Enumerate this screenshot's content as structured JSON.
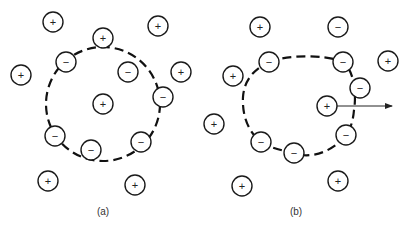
{
  "panels": [
    {
      "label": "(a)",
      "label_pos": [
        103,
        212
      ],
      "boundary": {
        "shape": "circle",
        "cx": 103,
        "cy": 104,
        "r": 57
      },
      "ions": [
        {
          "sign": "+",
          "x": 53,
          "y": 22
        },
        {
          "sign": "+",
          "x": 158,
          "y": 26
        },
        {
          "sign": "+",
          "x": 103,
          "y": 38
        },
        {
          "sign": "−",
          "x": 66,
          "y": 62
        },
        {
          "sign": "−",
          "x": 128,
          "y": 72
        },
        {
          "sign": "+",
          "x": 21,
          "y": 75
        },
        {
          "sign": "+",
          "x": 181,
          "y": 72
        },
        {
          "sign": "−",
          "x": 163,
          "y": 97
        },
        {
          "sign": "+",
          "x": 103,
          "y": 104
        },
        {
          "sign": "−",
          "x": 55,
          "y": 136
        },
        {
          "sign": "−",
          "x": 141,
          "y": 142
        },
        {
          "sign": "−",
          "x": 91,
          "y": 150
        },
        {
          "sign": "+",
          "x": 48,
          "y": 181
        },
        {
          "sign": "+",
          "x": 135,
          "y": 185
        }
      ]
    },
    {
      "label": "(b)",
      "label_pos": [
        296,
        212
      ],
      "boundary": {
        "shape": "path",
        "d": "M 269 62 C 285 55, 325 54, 343 62 C 356 72, 356 100, 354 110 C 353 122, 350 130, 346 135 C 335 150, 312 160, 294 153 C 280 150, 268 147, 261 142 C 248 132, 242 115, 243 97 C 244 82, 252 70, 269 62 Z"
      },
      "arrow": {
        "x1": 337,
        "y1": 106,
        "x2": 392,
        "y2": 106
      },
      "ions": [
        {
          "sign": "+",
          "x": 260,
          "y": 27
        },
        {
          "sign": "−",
          "x": 338,
          "y": 27
        },
        {
          "sign": "−",
          "x": 269,
          "y": 62
        },
        {
          "sign": "−",
          "x": 343,
          "y": 62
        },
        {
          "sign": "+",
          "x": 388,
          "y": 61
        },
        {
          "sign": "+",
          "x": 233,
          "y": 76
        },
        {
          "sign": "−",
          "x": 360,
          "y": 88
        },
        {
          "sign": "+",
          "x": 327,
          "y": 106
        },
        {
          "sign": "+",
          "x": 214,
          "y": 124
        },
        {
          "sign": "−",
          "x": 346,
          "y": 135
        },
        {
          "sign": "−",
          "x": 261,
          "y": 142
        },
        {
          "sign": "−",
          "x": 294,
          "y": 153
        },
        {
          "sign": "+",
          "x": 242,
          "y": 186
        },
        {
          "sign": "+",
          "x": 338,
          "y": 181
        }
      ]
    }
  ],
  "ion_radius": 10
}
